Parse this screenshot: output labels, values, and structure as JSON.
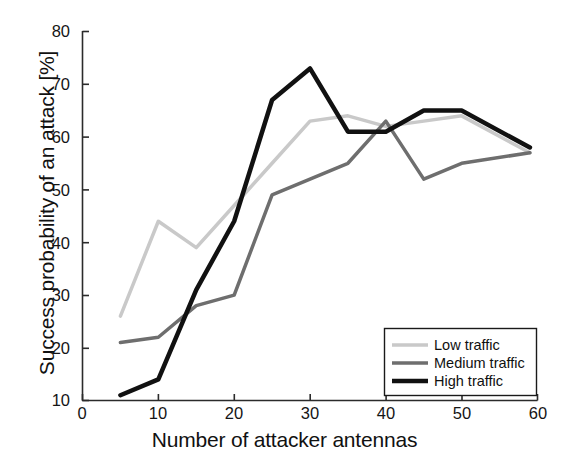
{
  "chart_data": {
    "type": "line",
    "title": "",
    "xlabel": "Number of attacker antennas",
    "ylabel": "Success probability of an attack [%]",
    "xlim": [
      0,
      60
    ],
    "ylim": [
      10,
      80
    ],
    "xticks": [
      0,
      10,
      20,
      30,
      40,
      50,
      60
    ],
    "xtick_labels": [
      "0",
      "10",
      "20",
      "30",
      "40",
      "50",
      "60"
    ],
    "yticks": [
      10,
      20,
      30,
      40,
      50,
      60,
      70,
      80
    ],
    "ytick_labels": [
      "10",
      "20",
      "30",
      "40",
      "50",
      "60",
      "70",
      "80"
    ],
    "grid": false,
    "legend_position": "lower right",
    "x": [
      5,
      10,
      15,
      20,
      25,
      30,
      35,
      40,
      45,
      50,
      59
    ],
    "series": [
      {
        "name": "Low traffic",
        "color": "#c9c9c9",
        "width": 3.5,
        "values": [
          26,
          44,
          39,
          47,
          55,
          63,
          64,
          62,
          63,
          64,
          57
        ]
      },
      {
        "name": "Medium traffic",
        "color": "#6e6e6e",
        "width": 3.5,
        "values": [
          21,
          22,
          28,
          30,
          49,
          52,
          55,
          63,
          52,
          55,
          57
        ]
      },
      {
        "name": "High traffic",
        "color": "#111111",
        "width": 4.5,
        "values": [
          11,
          14,
          31,
          44,
          67,
          73,
          61,
          61,
          65,
          65,
          58
        ]
      }
    ]
  },
  "axes": {
    "x_title": "Number of attacker antennas",
    "y_title": "Success probability of an attack [%]",
    "x_tick_0": "0",
    "x_tick_1": "10",
    "x_tick_2": "20",
    "x_tick_3": "30",
    "x_tick_4": "40",
    "x_tick_5": "50",
    "x_tick_6": "60",
    "y_tick_0": "10",
    "y_tick_1": "20",
    "y_tick_2": "30",
    "y_tick_3": "40",
    "y_tick_4": "50",
    "y_tick_5": "60",
    "y_tick_6": "70",
    "y_tick_7": "80"
  },
  "legend": {
    "entries": [
      {
        "label": "Low traffic",
        "color": "#c9c9c9"
      },
      {
        "label": "Medium traffic",
        "color": "#6e6e6e"
      },
      {
        "label": "High traffic",
        "color": "#111111"
      }
    ]
  }
}
